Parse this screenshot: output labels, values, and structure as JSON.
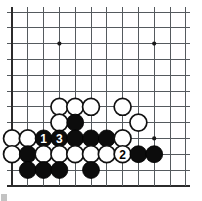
{
  "diagram": {
    "kind": "go-board-diagram",
    "board": {
      "columns": 12,
      "rows": 12,
      "spacing_px": 15.8,
      "origin_x_px": 12,
      "origin_y_px": 12,
      "line_color": "#555a5e",
      "edge_color": "#2b2b2b",
      "background_color": "#ffffff",
      "bottom_edge_row": 11,
      "left_edge_col": 0
    },
    "star_points": [
      {
        "col": 3,
        "row": 2
      },
      {
        "col": 9,
        "row": 2
      },
      {
        "col": 9,
        "row": 8
      }
    ],
    "stones": [
      {
        "col": 3,
        "row": 6,
        "color": "white",
        "label": ""
      },
      {
        "col": 4,
        "row": 6,
        "color": "white",
        "label": ""
      },
      {
        "col": 5,
        "row": 6,
        "color": "white",
        "label": ""
      },
      {
        "col": 7,
        "row": 6,
        "color": "white",
        "label": ""
      },
      {
        "col": 3,
        "row": 7,
        "color": "white",
        "label": ""
      },
      {
        "col": 4,
        "row": 7,
        "color": "black",
        "label": ""
      },
      {
        "col": 8,
        "row": 7,
        "color": "white",
        "label": ""
      },
      {
        "col": 0,
        "row": 8,
        "color": "white",
        "label": ""
      },
      {
        "col": 1,
        "row": 8,
        "color": "white",
        "label": ""
      },
      {
        "col": 2,
        "row": 8,
        "color": "black",
        "label": "1"
      },
      {
        "col": 3,
        "row": 8,
        "color": "black",
        "label": "3"
      },
      {
        "col": 4,
        "row": 8,
        "color": "black",
        "label": ""
      },
      {
        "col": 5,
        "row": 8,
        "color": "black",
        "label": ""
      },
      {
        "col": 6,
        "row": 8,
        "color": "black",
        "label": ""
      },
      {
        "col": 7,
        "row": 8,
        "color": "white",
        "label": ""
      },
      {
        "col": 0,
        "row": 9,
        "color": "white",
        "label": ""
      },
      {
        "col": 1,
        "row": 9,
        "color": "black",
        "label": ""
      },
      {
        "col": 2,
        "row": 9,
        "color": "white",
        "label": ""
      },
      {
        "col": 3,
        "row": 9,
        "color": "white",
        "label": ""
      },
      {
        "col": 4,
        "row": 9,
        "color": "white",
        "label": ""
      },
      {
        "col": 5,
        "row": 9,
        "color": "white",
        "label": ""
      },
      {
        "col": 6,
        "row": 9,
        "color": "white",
        "label": ""
      },
      {
        "col": 7,
        "row": 9,
        "color": "white",
        "label": "2"
      },
      {
        "col": 8,
        "row": 9,
        "color": "black",
        "label": ""
      },
      {
        "col": 9,
        "row": 9,
        "color": "black",
        "label": ""
      },
      {
        "col": 1,
        "row": 10,
        "color": "black",
        "label": ""
      },
      {
        "col": 2,
        "row": 10,
        "color": "black",
        "label": ""
      },
      {
        "col": 3,
        "row": 10,
        "color": "black",
        "label": ""
      },
      {
        "col": 5,
        "row": 10,
        "color": "black",
        "label": ""
      }
    ],
    "move_labels": [
      "1",
      "2",
      "3"
    ]
  }
}
